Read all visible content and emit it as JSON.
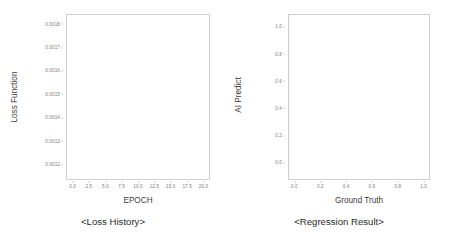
{
  "figures": [
    {
      "id": "loss-history",
      "caption": "<Loss History>",
      "xlabel": "EPOCH",
      "ylabel": "Loss Function",
      "xticks": [
        "0.0",
        "2.5",
        "5.0",
        "7.5",
        "10.0",
        "12.5",
        "15.0",
        "17.5",
        "20.0"
      ],
      "yticks": [
        "0.0012",
        "0.0013",
        "0.0014",
        "0.0015",
        "0.0016",
        "0.0017",
        "0.0018"
      ]
    },
    {
      "id": "regression-result",
      "caption": "<Regression Result>",
      "xlabel": "Ground Truth",
      "ylabel": "AI Predict",
      "xticks": [
        "0.0",
        "0.2",
        "0.4",
        "0.6",
        "0.8",
        "1.0"
      ],
      "yticks": [
        "0.0",
        "0.2",
        "0.4",
        "0.6",
        "0.8",
        "1.0"
      ]
    }
  ],
  "colors": {
    "frame": "#cfcfcf",
    "tick_text": "#7a7a7a",
    "axis_label": "#3d3d3d",
    "caption": "#2b2b2b",
    "background": "#ffffff"
  },
  "chart_data": [
    {
      "type": "line",
      "title": "<Loss History>",
      "xlabel": "EPOCH",
      "ylabel": "Loss Function",
      "xlim": [
        -0.95,
        20.95
      ],
      "ylim": [
        0.00115,
        0.00185
      ],
      "xticks": [
        0.0,
        2.5,
        5.0,
        7.5,
        10.0,
        12.5,
        15.0,
        17.5,
        20.0
      ],
      "yticks": [
        0.0012,
        0.0013,
        0.0014,
        0.0015,
        0.0016,
        0.0017,
        0.0018
      ],
      "grid": false,
      "legend": false,
      "series": [],
      "x": [],
      "values": [],
      "note": "Empty axes - no data series plotted"
    },
    {
      "type": "scatter",
      "title": "<Regression Result>",
      "xlabel": "Ground Truth",
      "ylabel": "AI Predict",
      "xlim": [
        -0.05,
        1.05
      ],
      "ylim": [
        -0.05,
        1.05
      ],
      "xticks": [
        0.0,
        0.2,
        0.4,
        0.6,
        0.8,
        1.0
      ],
      "yticks": [
        0.0,
        0.2,
        0.4,
        0.6,
        0.8,
        1.0
      ],
      "grid": false,
      "legend": false,
      "series": [],
      "x": [],
      "values": [],
      "note": "Empty axes - no data points plotted"
    }
  ]
}
